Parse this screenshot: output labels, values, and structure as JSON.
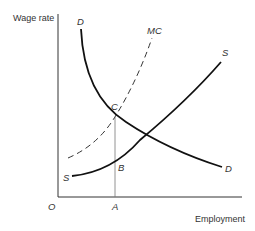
{
  "diagram": {
    "type": "labor-market-monopsony",
    "y_axis_label": "Wage rate",
    "x_axis_label": "Employment",
    "origin_label": "O",
    "curves": [
      {
        "id": "demand",
        "label_start": "D",
        "label_end": "D",
        "style": "solid"
      },
      {
        "id": "marginal-cost",
        "label": "MC",
        "style": "dashed"
      },
      {
        "id": "supply",
        "label_start": "S",
        "label_end": "S",
        "style": "solid"
      }
    ],
    "points": [
      {
        "id": "C",
        "label": "C",
        "description": "intersection of D and MC"
      },
      {
        "id": "B",
        "label": "B",
        "description": "point on S directly below C"
      },
      {
        "id": "A",
        "label": "A",
        "description": "employment level on x-axis"
      }
    ],
    "colors": {
      "line": "#111111",
      "text": "#333333",
      "guide": "#777777"
    }
  }
}
